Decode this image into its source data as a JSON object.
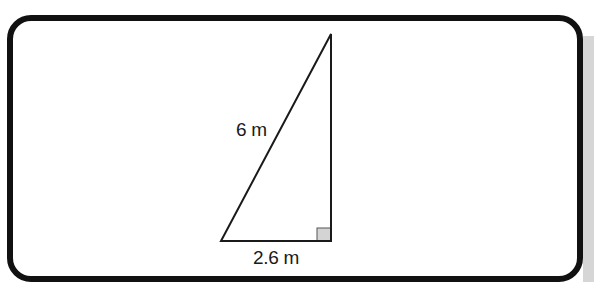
{
  "diagram": {
    "type": "right-triangle",
    "hypotenuse_label": "6 m",
    "base_label": "2.6 m",
    "vertices": {
      "apex": [
        331,
        34
      ],
      "bottom_left": [
        221,
        241
      ],
      "right_angle": [
        331,
        241
      ]
    },
    "right_angle_marker_fill": "#d4d4d4",
    "stroke_color": "#1a1a1a",
    "frame_color": "#111111"
  }
}
